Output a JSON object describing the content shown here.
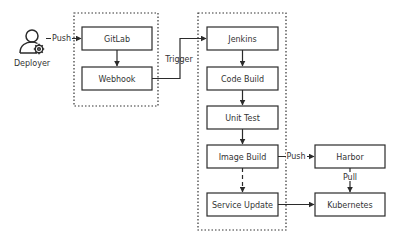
{
  "actor": {
    "label": "Deployer",
    "icon": "user-gear-icon"
  },
  "groups": [
    {
      "id": "source-group",
      "nodes": [
        "gitlab",
        "webhook"
      ]
    },
    {
      "id": "ci-group",
      "nodes": [
        "jenkins",
        "code-build",
        "unit-test",
        "image-build",
        "service-update"
      ]
    }
  ],
  "nodes": {
    "gitlab": "GitLab",
    "webhook": "Webhook",
    "jenkins": "Jenkins",
    "code_build": "Code Build",
    "unit_test": "Unit Test",
    "image_build": "Image Build",
    "service_update": "Service Update",
    "harbor": "Harbor",
    "kubernetes": "Kubernetes"
  },
  "edges": {
    "push1": "Push",
    "trigger": "Trigger",
    "push2": "Push",
    "pull": "Pull"
  },
  "edge_list": [
    {
      "from": "Deployer",
      "to": "GitLab",
      "label": "Push",
      "style": "solid"
    },
    {
      "from": "GitLab",
      "to": "Webhook",
      "label": "",
      "style": "solid"
    },
    {
      "from": "Webhook",
      "to": "Jenkins",
      "label": "Trigger",
      "style": "solid"
    },
    {
      "from": "Jenkins",
      "to": "Code Build",
      "label": "",
      "style": "solid"
    },
    {
      "from": "Code Build",
      "to": "Unit Test",
      "label": "",
      "style": "solid"
    },
    {
      "from": "Unit Test",
      "to": "Image Build",
      "label": "",
      "style": "solid"
    },
    {
      "from": "Image Build",
      "to": "Service Update",
      "label": "",
      "style": "dashed"
    },
    {
      "from": "Image Build",
      "to": "Harbor",
      "label": "Push",
      "style": "solid"
    },
    {
      "from": "Harbor",
      "to": "Kubernetes",
      "label": "Pull",
      "style": "solid"
    },
    {
      "from": "Service Update",
      "to": "Kubernetes",
      "label": "",
      "style": "solid"
    }
  ]
}
